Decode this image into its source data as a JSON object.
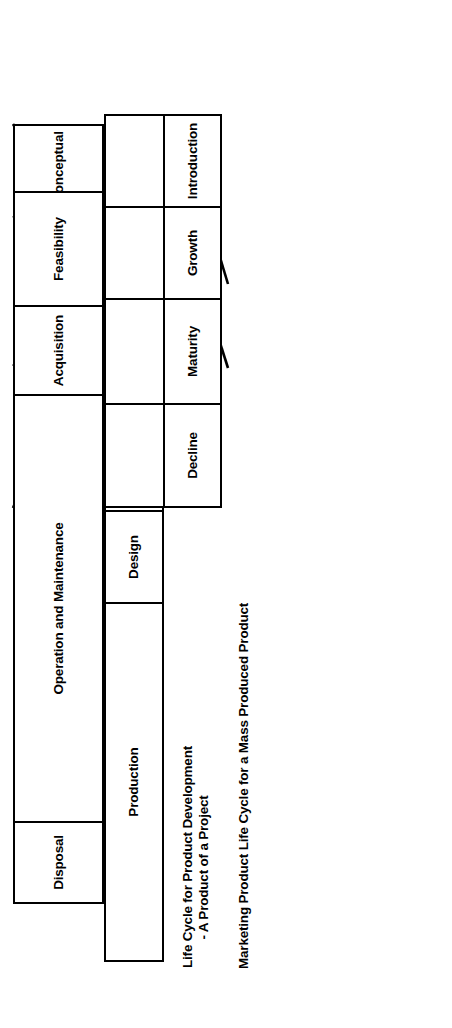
{
  "diagram": {
    "orientation": "rotated-90-ccw",
    "line_color": "#000000",
    "background_color": "#ffffff",
    "bands": [
      {
        "id": "project-life-cycle",
        "caption": "Project Life Cycle",
        "phases": [
          {
            "label": "Conceptual"
          },
          {
            "label": "Development"
          },
          {
            "label": "Implementation"
          },
          {
            "label": "Termination"
          }
        ]
      },
      {
        "id": "capital-facility-life-cycle",
        "caption": "Product Life Cycle for a Capital\nFacility - A Product of a Project",
        "phases": [
          {
            "label": "Feasibility"
          },
          {
            "label": "Acquisition"
          },
          {
            "label": "Operation and Maintenance"
          },
          {
            "label": "Disposal"
          }
        ]
      },
      {
        "id": "product-development-life-cycle",
        "caption": "Life Cycle for Product Development\n        - A Product of a Project",
        "phases": [
          {
            "label": "Basic Research"
          },
          {
            "label": "Product Research"
          },
          {
            "label": "Design"
          },
          {
            "label": "Production"
          }
        ]
      },
      {
        "id": "marketing-product-life-cycle",
        "caption": "Marketing Product Life Cycle for a Mass Produced Product",
        "phases": [
          {
            "label": "Introduction"
          },
          {
            "label": "Growth"
          },
          {
            "label": "Maturity"
          },
          {
            "label": "Decline"
          }
        ]
      }
    ]
  }
}
